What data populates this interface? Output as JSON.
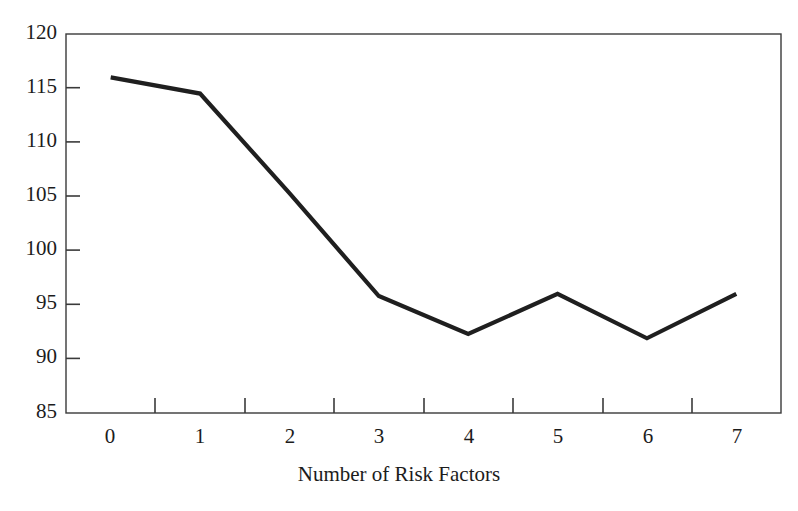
{
  "chart_data": {
    "type": "line",
    "title": "",
    "xlabel": "Number of Risk Factors",
    "ylabel": "",
    "x": [
      0,
      1,
      2,
      3,
      4,
      5,
      6,
      7
    ],
    "categories": [
      "0",
      "1",
      "2",
      "3",
      "4",
      "5",
      "6",
      "7"
    ],
    "values": [
      116,
      114.5,
      105.3,
      95.8,
      92.3,
      96,
      91.9,
      96
    ],
    "series": [
      {
        "name": "",
        "values": [
          116,
          114.5,
          105.3,
          95.8,
          92.3,
          96,
          91.9,
          96
        ]
      }
    ],
    "xlim": [
      0,
      7
    ],
    "ylim": [
      85,
      120
    ],
    "y_ticks": [
      85,
      90,
      95,
      100,
      105,
      110,
      115,
      120
    ],
    "y_tick_labels": [
      "85",
      "90",
      "95",
      "100",
      "105",
      "110",
      "115",
      "120"
    ],
    "x_tick_labels": [
      "0",
      "1",
      "2",
      "3",
      "4",
      "5",
      "6",
      "7"
    ],
    "grid": false,
    "legend": false,
    "legend_position": "none",
    "line_color": "#1f1f1f",
    "frame_color": "#3a3a3a",
    "background_color": "#ffffff",
    "markers": false
  },
  "figure": {
    "background_color": "#ffffff"
  }
}
